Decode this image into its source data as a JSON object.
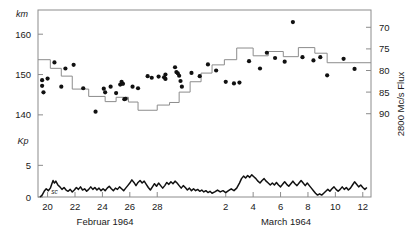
{
  "figure": {
    "background": "#ffffff",
    "frame_color": "#8c8c8c",
    "marker_color": "#111111",
    "trace_color": "#111111",
    "flux_color": "#8c8c8c"
  },
  "axes": {
    "left_top": {
      "label": "km",
      "ticks": [
        {
          "value": 160,
          "label": "160"
        },
        {
          "value": 150,
          "label": "150"
        },
        {
          "value": 140,
          "label": "140"
        }
      ]
    },
    "left_bottom": {
      "label": "Kp",
      "ticks": [
        {
          "value": 5,
          "label": "5"
        },
        {
          "value": 0,
          "label": "0"
        }
      ]
    },
    "right": {
      "label": "2800 Mc/s Flux",
      "ticks": [
        {
          "value": 70,
          "label": "70"
        },
        {
          "value": 75,
          "label": "75"
        },
        {
          "value": 80,
          "label": "80"
        },
        {
          "value": 85,
          "label": "85"
        },
        {
          "value": 90,
          "label": "90"
        }
      ]
    },
    "bottom": {
      "month_labels": [
        "Februar 1964",
        "March 1964"
      ],
      "ticks": [
        {
          "value": 20,
          "label": "20"
        },
        {
          "value": 22,
          "label": "22"
        },
        {
          "value": 24,
          "label": "24"
        },
        {
          "value": 26,
          "label": "26"
        },
        {
          "value": 28,
          "label": "28"
        },
        {
          "value": 33,
          "label": "2"
        },
        {
          "value": 35,
          "label": "4"
        },
        {
          "value": 37,
          "label": "6"
        },
        {
          "value": 39,
          "label": "8"
        },
        {
          "value": 41,
          "label": "10"
        },
        {
          "value": 43,
          "label": "12"
        }
      ]
    }
  },
  "annotations": [
    {
      "name": "sudden-commencement",
      "text": "sc",
      "x": 20.5,
      "y": 0.4
    }
  ],
  "chart_data": {
    "type": "scatter",
    "title": "",
    "xlabel": "Februar 1964 / March 1964",
    "ylabel": "km",
    "xlim": [
      19.3,
      43.6
    ],
    "grid": false,
    "legend": "none",
    "series": [
      {
        "name": "Ionospheric height (km)",
        "type": "scatter",
        "unit": "km",
        "ylim": [
          136,
          166
        ],
        "axis": "left-top",
        "points": [
          [
            19.6,
            148.6
          ],
          [
            19.6,
            147.2
          ],
          [
            19.7,
            145.6
          ],
          [
            20.0,
            149.0
          ],
          [
            20.5,
            153.0
          ],
          [
            21.0,
            147.0
          ],
          [
            21.3,
            151.5
          ],
          [
            21.9,
            152.4
          ],
          [
            22.6,
            146.6
          ],
          [
            23.5,
            140.8
          ],
          [
            24.1,
            146.5
          ],
          [
            24.2,
            145.6
          ],
          [
            24.6,
            147.0
          ],
          [
            25.0,
            145.4
          ],
          [
            25.3,
            147.5
          ],
          [
            25.4,
            148.2
          ],
          [
            25.5,
            147.7
          ],
          [
            25.6,
            143.9
          ],
          [
            25.7,
            144.0
          ],
          [
            26.2,
            147.0
          ],
          [
            26.6,
            146.6
          ],
          [
            27.3,
            149.6
          ],
          [
            27.6,
            149.2
          ],
          [
            28.1,
            149.5
          ],
          [
            28.5,
            149.3
          ],
          [
            28.6,
            150.0
          ],
          [
            28.6,
            148.9
          ],
          [
            29.3,
            151.8
          ],
          [
            29.4,
            150.6
          ],
          [
            29.5,
            150.3
          ],
          [
            29.6,
            149.7
          ],
          [
            29.7,
            148.4
          ],
          [
            29.8,
            147.0
          ],
          [
            30.5,
            150.4
          ],
          [
            31.1,
            149.6
          ],
          [
            31.7,
            152.5
          ],
          [
            32.3,
            151.0
          ],
          [
            33.0,
            148.2
          ],
          [
            33.6,
            147.8
          ],
          [
            34.0,
            148.0
          ],
          [
            34.7,
            153.3
          ],
          [
            35.5,
            151.5
          ],
          [
            36.0,
            155.4
          ],
          [
            36.6,
            154.1
          ],
          [
            37.3,
            153.2
          ],
          [
            37.9,
            163.0
          ],
          [
            38.6,
            154.3
          ],
          [
            39.4,
            153.5
          ],
          [
            39.9,
            154.3
          ],
          [
            40.4,
            149.8
          ],
          [
            41.6,
            153.9
          ],
          [
            42.4,
            151.4
          ]
        ]
      },
      {
        "name": "2800 Mc/s solar flux",
        "type": "step",
        "unit": "flux units",
        "axis": "right-inverted",
        "ylim": [
          66,
          94
        ],
        "steps": [
          [
            19.3,
            77.5
          ],
          [
            20.2,
            77.5
          ],
          [
            20.2,
            79.5
          ],
          [
            21.0,
            79.5
          ],
          [
            21.0,
            81.3
          ],
          [
            21.8,
            81.3
          ],
          [
            21.8,
            84.3
          ],
          [
            23.0,
            84.3
          ],
          [
            23.0,
            86.0
          ],
          [
            24.2,
            86.0
          ],
          [
            24.2,
            87.2
          ],
          [
            25.0,
            87.2
          ],
          [
            25.0,
            86.2
          ],
          [
            25.9,
            86.2
          ],
          [
            25.9,
            87.3
          ],
          [
            26.6,
            87.3
          ],
          [
            26.6,
            89.2
          ],
          [
            28.0,
            89.2
          ],
          [
            28.0,
            88.0
          ],
          [
            28.9,
            88.0
          ],
          [
            28.9,
            87.4
          ],
          [
            29.6,
            87.4
          ],
          [
            29.6,
            85.0
          ],
          [
            30.4,
            85.0
          ],
          [
            30.4,
            82.6
          ],
          [
            31.2,
            82.6
          ],
          [
            31.2,
            80.6
          ],
          [
            32.0,
            80.6
          ],
          [
            32.0,
            78.7
          ],
          [
            32.9,
            78.7
          ],
          [
            32.9,
            77.5
          ],
          [
            33.8,
            77.5
          ],
          [
            33.8,
            74.8
          ],
          [
            35.0,
            74.8
          ],
          [
            35.0,
            76.6
          ],
          [
            36.1,
            76.6
          ],
          [
            36.1,
            75.6
          ],
          [
            37.2,
            75.6
          ],
          [
            37.2,
            76.8
          ],
          [
            38.3,
            76.8
          ],
          [
            38.3,
            74.7
          ],
          [
            39.5,
            74.7
          ],
          [
            39.5,
            76.0
          ],
          [
            40.4,
            76.0
          ],
          [
            40.4,
            78.2
          ],
          [
            43.6,
            78.2
          ]
        ]
      },
      {
        "name": "Kp planetary index",
        "type": "line",
        "unit": "Kp",
        "axis": "left-bottom",
        "ylim": [
          0,
          9
        ],
        "values": [
          [
            19.45,
            0.0
          ],
          [
            19.6,
            0.3
          ],
          [
            19.75,
            0.9
          ],
          [
            19.9,
            1.3
          ],
          [
            20.05,
            1.0
          ],
          [
            20.2,
            1.4
          ],
          [
            20.3,
            2.0
          ],
          [
            20.4,
            2.6
          ],
          [
            20.5,
            2.2
          ],
          [
            20.6,
            2.5
          ],
          [
            20.75,
            1.9
          ],
          [
            20.9,
            1.6
          ],
          [
            21.05,
            1.2
          ],
          [
            21.2,
            1.5
          ],
          [
            21.35,
            1.1
          ],
          [
            21.5,
            0.9
          ],
          [
            21.65,
            1.2
          ],
          [
            21.8,
            0.8
          ],
          [
            21.95,
            1.1
          ],
          [
            22.1,
            1.5
          ],
          [
            22.25,
            1.2
          ],
          [
            22.4,
            1.6
          ],
          [
            22.55,
            1.1
          ],
          [
            22.7,
            1.3
          ],
          [
            22.85,
            0.9
          ],
          [
            23.0,
            1.2
          ],
          [
            23.15,
            1.6
          ],
          [
            23.3,
            1.2
          ],
          [
            23.45,
            1.5
          ],
          [
            23.6,
            1.1
          ],
          [
            23.75,
            1.4
          ],
          [
            23.9,
            1.0
          ],
          [
            24.05,
            1.3
          ],
          [
            24.2,
            1.0
          ],
          [
            24.35,
            1.4
          ],
          [
            24.5,
            1.7
          ],
          [
            24.65,
            1.3
          ],
          [
            24.8,
            1.0
          ],
          [
            24.95,
            1.4
          ],
          [
            25.1,
            1.2
          ],
          [
            25.25,
            1.6
          ],
          [
            25.4,
            1.3
          ],
          [
            25.55,
            1.0
          ],
          [
            25.7,
            1.4
          ],
          [
            25.85,
            1.8
          ],
          [
            26.0,
            2.2
          ],
          [
            26.15,
            2.7
          ],
          [
            26.3,
            2.3
          ],
          [
            26.45,
            1.8
          ],
          [
            26.6,
            2.3
          ],
          [
            26.75,
            2.6
          ],
          [
            26.9,
            2.2
          ],
          [
            27.05,
            2.5
          ],
          [
            27.2,
            2.0
          ],
          [
            27.35,
            1.5
          ],
          [
            27.5,
            1.1
          ],
          [
            27.65,
            1.6
          ],
          [
            27.8,
            2.1
          ],
          [
            27.95,
            1.7
          ],
          [
            28.1,
            2.2
          ],
          [
            28.25,
            1.8
          ],
          [
            28.4,
            1.4
          ],
          [
            28.55,
            1.8
          ],
          [
            28.7,
            2.3
          ],
          [
            28.85,
            2.0
          ],
          [
            29.0,
            2.4
          ],
          [
            29.15,
            2.1
          ],
          [
            29.3,
            2.5
          ],
          [
            29.45,
            2.2
          ],
          [
            29.6,
            1.8
          ],
          [
            29.75,
            1.4
          ],
          [
            29.9,
            1.8
          ],
          [
            30.05,
            1.5
          ],
          [
            30.2,
            1.1
          ],
          [
            30.35,
            1.4
          ],
          [
            30.5,
            1.0
          ],
          [
            30.65,
            1.3
          ],
          [
            30.8,
            1.0
          ],
          [
            30.95,
            1.2
          ],
          [
            31.1,
            0.9
          ],
          [
            31.25,
            1.1
          ],
          [
            31.4,
            0.8
          ],
          [
            31.55,
            1.0
          ],
          [
            31.7,
            0.7
          ],
          [
            31.85,
            0.9
          ],
          [
            32.0,
            0.6
          ],
          [
            32.2,
            0.8
          ],
          [
            32.4,
            1.1
          ],
          [
            32.6,
            0.8
          ],
          [
            32.8,
            1.0
          ],
          [
            33.0,
            0.7
          ],
          [
            33.2,
            1.0
          ],
          [
            33.4,
            1.3
          ],
          [
            33.6,
            1.0
          ],
          [
            33.8,
            1.4
          ],
          [
            34.0,
            2.2
          ],
          [
            34.15,
            2.9
          ],
          [
            34.3,
            3.3
          ],
          [
            34.45,
            3.0
          ],
          [
            34.6,
            3.4
          ],
          [
            34.75,
            3.1
          ],
          [
            34.9,
            3.5
          ],
          [
            35.05,
            3.2
          ],
          [
            35.2,
            2.9
          ],
          [
            35.35,
            2.5
          ],
          [
            35.5,
            2.2
          ],
          [
            35.65,
            2.6
          ],
          [
            35.8,
            2.9
          ],
          [
            35.95,
            2.5
          ],
          [
            36.1,
            2.2
          ],
          [
            36.25,
            1.9
          ],
          [
            36.4,
            2.2
          ],
          [
            36.55,
            1.9
          ],
          [
            36.7,
            2.3
          ],
          [
            36.85,
            1.9
          ],
          [
            37.0,
            1.6
          ],
          [
            37.15,
            2.0
          ],
          [
            37.3,
            2.4
          ],
          [
            37.45,
            2.0
          ],
          [
            37.6,
            1.7
          ],
          [
            37.75,
            2.1
          ],
          [
            37.9,
            2.5
          ],
          [
            38.05,
            2.1
          ],
          [
            38.2,
            1.8
          ],
          [
            38.35,
            2.2
          ],
          [
            38.5,
            2.6
          ],
          [
            38.65,
            2.2
          ],
          [
            38.8,
            1.8
          ],
          [
            38.95,
            2.2
          ],
          [
            39.1,
            1.8
          ],
          [
            39.25,
            1.4
          ],
          [
            39.4,
            1.0
          ],
          [
            39.55,
            0.6
          ],
          [
            39.7,
            0.3
          ],
          [
            39.85,
            0.5
          ],
          [
            40.0,
            0.3
          ],
          [
            40.15,
            0.6
          ],
          [
            40.3,
            0.9
          ],
          [
            40.45,
            1.2
          ],
          [
            40.6,
            0.9
          ],
          [
            40.75,
            1.3
          ],
          [
            40.9,
            1.6
          ],
          [
            41.05,
            1.2
          ],
          [
            41.2,
            0.9
          ],
          [
            41.35,
            1.2
          ],
          [
            41.5,
            1.6
          ],
          [
            41.65,
            1.2
          ],
          [
            41.8,
            1.5
          ],
          [
            41.95,
            1.1
          ],
          [
            42.1,
            1.4
          ],
          [
            42.25,
            1.9
          ],
          [
            42.4,
            2.4
          ],
          [
            42.55,
            2.0
          ],
          [
            42.7,
            1.6
          ],
          [
            42.85,
            1.9
          ],
          [
            43.0,
            1.5
          ],
          [
            43.15,
            1.2
          ],
          [
            43.3,
            1.5
          ]
        ]
      }
    ]
  }
}
